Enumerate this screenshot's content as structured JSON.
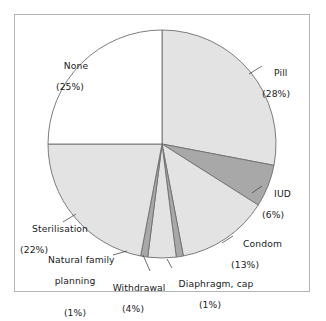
{
  "chart_data": {
    "type": "pie",
    "title": "",
    "subtitle": "",
    "xlabel": "",
    "ylabel": "",
    "legend_position": "none",
    "grid": false,
    "start_angle_deg": 0,
    "direction": "clockwise",
    "units": "percent",
    "categories": [
      "Pill",
      "IUD",
      "Condom",
      "Diaphragm, cap",
      "Withdrawal",
      "Natural family planning",
      "Sterilisation",
      "None"
    ],
    "values": [
      28,
      6,
      13,
      1,
      4,
      1,
      22,
      25
    ],
    "slices": [
      {
        "label": "Pill",
        "label_line1": "Pill",
        "percent_text": "(28%)",
        "value": 28,
        "fill": "#e3e3e3",
        "leader": true
      },
      {
        "label": "IUD",
        "label_line1": "IUD",
        "percent_text": "(6%)",
        "value": 6,
        "fill": "#a8a8a8",
        "leader": true
      },
      {
        "label": "Condom",
        "label_line1": "Condom",
        "percent_text": "(13%)",
        "value": 13,
        "fill": "#e3e3e3",
        "leader": true
      },
      {
        "label": "Diaphragm, cap",
        "label_line1": "Diaphragm, cap",
        "percent_text": "(1%)",
        "value": 1,
        "fill": "#a8a8a8",
        "leader": true
      },
      {
        "label": "Withdrawal",
        "label_line1": "Withdrawal",
        "percent_text": "(4%)",
        "value": 4,
        "fill": "#e3e3e3",
        "leader": true
      },
      {
        "label": "Natural family planning",
        "label_line1": "Natural family",
        "label_line2": "planning",
        "percent_text": "(1%)",
        "value": 1,
        "fill": "#a8a8a8",
        "leader": true
      },
      {
        "label": "Sterilisation",
        "label_line1": "Sterilisation",
        "percent_text": "(22%)",
        "value": 22,
        "fill": "#e3e3e3",
        "leader": true
      },
      {
        "label": "None",
        "label_line1": "None",
        "percent_text": "(25%)",
        "value": 25,
        "fill": "#ffffff",
        "leader": false
      }
    ],
    "colors": {
      "light_gray": "#e3e3e3",
      "dark_gray": "#a8a8a8",
      "white": "#ffffff",
      "outline": "#6e6e6e",
      "frame": "#b4b4b4",
      "text": "#1a1a1a"
    }
  }
}
